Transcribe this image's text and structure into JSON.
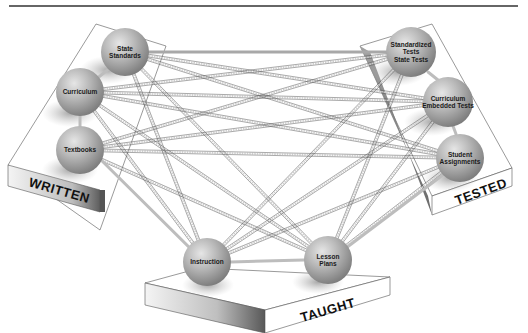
{
  "diagram": {
    "type": "curriculum-alignment-network",
    "rule_color": "#333333",
    "planes": [
      {
        "id": "written",
        "label": "WRITTEN"
      },
      {
        "id": "tested",
        "label": "TESTED"
      },
      {
        "id": "taught",
        "label": "TAUGHT"
      }
    ],
    "nodes": [
      {
        "id": "state-standards",
        "plane": "written",
        "lines": [
          "State",
          "Standards"
        ],
        "cx": 125,
        "cy": 52,
        "r": 24
      },
      {
        "id": "curriculum",
        "plane": "written",
        "lines": [
          "Curriculum"
        ],
        "cx": 80,
        "cy": 92,
        "r": 24
      },
      {
        "id": "textbooks",
        "plane": "written",
        "lines": [
          "Textbooks"
        ],
        "cx": 80,
        "cy": 150,
        "r": 24
      },
      {
        "id": "standardized-tests",
        "plane": "tested",
        "lines": [
          "Standardized",
          "Tests",
          "State Tests"
        ],
        "cx": 411,
        "cy": 52,
        "r": 25
      },
      {
        "id": "curriculum-embedded-tests",
        "plane": "tested",
        "lines": [
          "Curriculum",
          "Embedded Tests"
        ],
        "cx": 448,
        "cy": 102,
        "r": 25
      },
      {
        "id": "student-assignments",
        "plane": "tested",
        "lines": [
          "Student",
          "Assignments"
        ],
        "cx": 460,
        "cy": 158,
        "r": 24
      },
      {
        "id": "instruction",
        "plane": "taught",
        "lines": [
          "Instruction"
        ],
        "cx": 207,
        "cy": 262,
        "r": 24
      },
      {
        "id": "lesson-plans",
        "plane": "taught",
        "lines": [
          "Lesson",
          "Plans"
        ],
        "cx": 328,
        "cy": 260,
        "r": 24
      }
    ]
  }
}
